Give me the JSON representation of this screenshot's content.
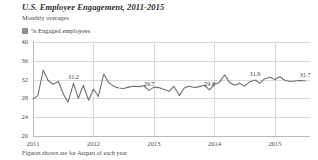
{
  "header": {
    "title": "U.S. Employee Engagement, 2011-2015",
    "subtitle": "Monthly averages"
  },
  "legend": {
    "swatch_icon": "legend-swatch-icon",
    "label": "% Engaged employees",
    "color": "#8d8d8d"
  },
  "footnote": "Figures shown are for August of each year",
  "chart_data": {
    "type": "line",
    "title": "U.S. Employee Engagement, 2011-2015",
    "subtitle": "Monthly averages",
    "xlabel": "",
    "ylabel": "",
    "ylim": [
      20,
      40
    ],
    "yticks": [
      20,
      24,
      28,
      32,
      36,
      40
    ],
    "ytick_labels": [
      "20",
      "24",
      "28",
      "32",
      "36",
      "40"
    ],
    "xticks": [
      2011,
      2012,
      2013,
      2014,
      2015
    ],
    "xtick_labels": [
      "2011",
      "2012",
      "2013",
      "2014",
      "2015"
    ],
    "grid": true,
    "legend_position": "top-left",
    "line_color": "#6f6f6f",
    "series": [
      {
        "name": "% Engaged employees",
        "x": [
          2011.0,
          2011.08,
          2011.17,
          2011.25,
          2011.33,
          2011.42,
          2011.5,
          2011.58,
          2011.67,
          2011.75,
          2011.83,
          2011.92,
          2012.0,
          2012.08,
          2012.17,
          2012.25,
          2012.33,
          2012.42,
          2012.5,
          2012.58,
          2012.67,
          2012.75,
          2012.83,
          2012.92,
          2013.0,
          2013.08,
          2013.17,
          2013.25,
          2013.33,
          2013.42,
          2013.5,
          2013.58,
          2013.67,
          2013.75,
          2013.83,
          2013.92,
          2014.0,
          2014.08,
          2014.17,
          2014.25,
          2014.33,
          2014.42,
          2014.5,
          2014.58,
          2014.67,
          2014.75,
          2014.83,
          2014.92,
          2015.0,
          2015.08,
          2015.17,
          2015.25,
          2015.33,
          2015.42,
          2015.5
        ],
        "values": [
          27.9,
          28.6,
          34.0,
          31.8,
          31.0,
          31.6,
          29.0,
          27.2,
          31.2,
          28.0,
          30.8,
          27.6,
          30.0,
          28.4,
          33.2,
          31.4,
          30.6,
          30.2,
          30.1,
          30.4,
          30.6,
          30.5,
          30.7,
          29.7,
          30.4,
          30.3,
          29.9,
          29.5,
          30.6,
          28.6,
          30.2,
          30.6,
          30.3,
          30.5,
          30.8,
          29.8,
          31.0,
          31.4,
          33.0,
          31.4,
          30.8,
          31.2,
          30.6,
          31.5,
          31.9,
          31.2,
          32.2,
          32.5,
          32.0,
          32.6,
          31.8,
          31.6,
          31.7,
          31.8,
          31.7
        ]
      }
    ],
    "annotations": [
      {
        "label": "31.2",
        "x": 2011.67,
        "y": 31.2
      },
      {
        "label": "29.7",
        "x": 2012.92,
        "y": 29.7
      },
      {
        "label": "29.8",
        "x": 2013.92,
        "y": 29.8
      },
      {
        "label": "31.9",
        "x": 2014.67,
        "y": 31.9
      },
      {
        "label": "31.7",
        "x": 2015.5,
        "y": 31.7
      }
    ]
  }
}
